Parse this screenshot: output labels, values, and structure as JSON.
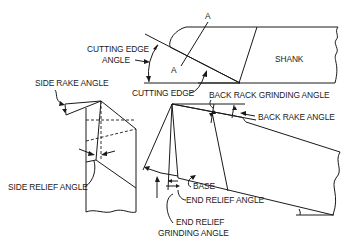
{
  "diagram": {
    "labels": {
      "section_a_top": "A",
      "section_a_bottom": "A",
      "cutting_edge_angle_line1": "CUTTING EDGE",
      "cutting_edge_angle_line2": "ANGLE",
      "shank": "SHANK",
      "cutting_edge": "CUTTING EDGE",
      "side_rake_angle": "SIDE RAKE ANGLE",
      "back_rack_grinding_angle": "BACK RACK GRINDING ANGLE",
      "back_rake_angle": "BACK RAKE ANGLE",
      "side_relief_angle": "SIDE RELIEF ANGLE",
      "base": "BASE",
      "end_relief_angle": "END RELIEF ANGLE",
      "end_relief_grinding_angle_line1": "END RELIEF",
      "end_relief_grinding_angle_line2": "GRINDING ANGLE"
    },
    "views": [
      "top-view-tool-with-shank",
      "side-section-view",
      "end-isometric-view"
    ],
    "line_color": "#1a1a1a",
    "background": "#ffffff"
  }
}
